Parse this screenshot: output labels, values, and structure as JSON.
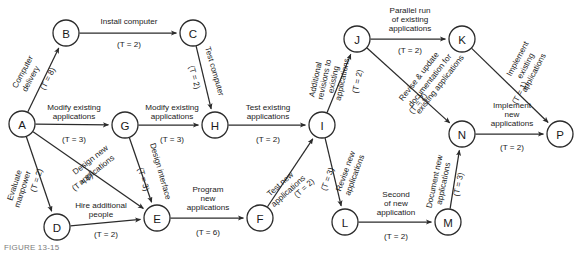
{
  "figure": {
    "type": "project-network-diagram",
    "caption": "FIGURE 13-15",
    "duration_prefix": "(T = ",
    "duration_suffix": ")"
  },
  "colors": {
    "stroke": "#2b2b2b",
    "background": "#ffffff",
    "text": "#1a1a1a",
    "caption": "#7c7c7c"
  },
  "nodes": [
    {
      "id": "A",
      "label": "A",
      "x": 22,
      "y": 124,
      "r": 13
    },
    {
      "id": "B",
      "label": "B",
      "x": 66,
      "y": 33,
      "r": 13
    },
    {
      "id": "C",
      "label": "C",
      "x": 193,
      "y": 33,
      "r": 13
    },
    {
      "id": "D",
      "label": "D",
      "x": 57,
      "y": 227,
      "r": 13
    },
    {
      "id": "E",
      "label": "E",
      "x": 157,
      "y": 218,
      "r": 13
    },
    {
      "id": "F",
      "label": "F",
      "x": 260,
      "y": 218,
      "r": 13
    },
    {
      "id": "G",
      "label": "G",
      "x": 125,
      "y": 125,
      "r": 13
    },
    {
      "id": "H",
      "label": "H",
      "x": 215,
      "y": 125,
      "r": 13
    },
    {
      "id": "I",
      "label": "I",
      "x": 322,
      "y": 125,
      "r": 13
    },
    {
      "id": "J",
      "label": "J",
      "x": 357,
      "y": 39,
      "r": 13
    },
    {
      "id": "K",
      "label": "K",
      "x": 462,
      "y": 39,
      "r": 13
    },
    {
      "id": "L",
      "label": "L",
      "x": 345,
      "y": 222,
      "r": 13
    },
    {
      "id": "M",
      "label": "M",
      "x": 448,
      "y": 222,
      "r": 13
    },
    {
      "id": "N",
      "label": "N",
      "x": 462,
      "y": 134,
      "r": 13
    },
    {
      "id": "P",
      "label": "P",
      "x": 560,
      "y": 134,
      "r": 13
    }
  ],
  "edges": [
    {
      "id": "A-B",
      "from": "A",
      "to": "B",
      "activity": [
        "Computer",
        "delivery"
      ],
      "duration": "(T = 8)",
      "duration_value": 8,
      "label_lines_pos": [
        {
          "x": 25,
          "y": 73
        },
        {
          "x": 33,
          "y": 80
        }
      ],
      "label_rotate": -62,
      "duration_pos": {
        "x": 50,
        "y": 80
      },
      "duration_rotate": -62
    },
    {
      "id": "B-C",
      "from": "B",
      "to": "C",
      "activity": [
        "Install computer"
      ],
      "duration": "(T = 2)",
      "duration_value": 2,
      "label_lines_pos": [
        {
          "x": 129,
          "y": 24
        }
      ],
      "label_rotate": 0,
      "duration_pos": {
        "x": 129,
        "y": 47
      },
      "duration_rotate": 0
    },
    {
      "id": "C-H",
      "from": "C",
      "to": "H",
      "activity": [
        "Test computer"
      ],
      "duration": "(T = 2)",
      "duration_value": 2,
      "label_lines_pos": [
        {
          "x": 212,
          "y": 72
        }
      ],
      "label_rotate": 74,
      "duration_pos": {
        "x": 192,
        "y": 78
      },
      "duration_rotate": 74
    },
    {
      "id": "A-G",
      "from": "A",
      "to": "G",
      "activity": [
        "Modify existing",
        "applications"
      ],
      "duration": "(T = 3)",
      "duration_value": 3,
      "label_lines_pos": [
        {
          "x": 74,
          "y": 110
        },
        {
          "x": 74,
          "y": 119
        }
      ],
      "label_rotate": 0,
      "duration_pos": {
        "x": 74,
        "y": 142
      },
      "duration_rotate": 0
    },
    {
      "id": "G-H",
      "from": "G",
      "to": "H",
      "activity": [
        "Modify existing",
        "applications"
      ],
      "duration": "(T = 3)",
      "duration_value": 3,
      "label_lines_pos": [
        {
          "x": 172,
          "y": 110
        },
        {
          "x": 172,
          "y": 119
        }
      ],
      "label_rotate": 0,
      "duration_pos": {
        "x": 172,
        "y": 142
      },
      "duration_rotate": 0
    },
    {
      "id": "H-I",
      "from": "H",
      "to": "I",
      "activity": [
        "Test existing",
        "applications"
      ],
      "duration": "(T = 2)",
      "duration_value": 2,
      "label_lines_pos": [
        {
          "x": 268,
          "y": 110
        },
        {
          "x": 268,
          "y": 119
        }
      ],
      "label_rotate": 0,
      "duration_pos": {
        "x": 268,
        "y": 142
      },
      "duration_rotate": 0
    },
    {
      "id": "A-D",
      "from": "A",
      "to": "D",
      "activity": [
        "Evaluate",
        "manpower"
      ],
      "duration": "(T = 2)",
      "duration_value": 2,
      "label_lines_pos": [
        {
          "x": 17,
          "y": 186
        },
        {
          "x": 25,
          "y": 190
        }
      ],
      "label_rotate": -72,
      "duration_pos": {
        "x": 39,
        "y": 181
      },
      "duration_rotate": -72
    },
    {
      "id": "A-E",
      "from": "A",
      "to": "E",
      "activity": [
        "Design new",
        "applications"
      ],
      "duration": "(T = 8)",
      "duration_value": 8,
      "label_lines_pos": [
        {
          "x": 92,
          "y": 162
        },
        {
          "x": 98,
          "y": 172
        }
      ],
      "label_rotate": -38,
      "duration_pos": {
        "x": 84,
        "y": 184
      },
      "duration_rotate": -38
    },
    {
      "id": "G-E",
      "from": "G",
      "to": "E",
      "activity": [
        "Design interface"
      ],
      "duration": "(T = 3)",
      "duration_value": 3,
      "label_lines_pos": [
        {
          "x": 158,
          "y": 172
        }
      ],
      "label_rotate": 74,
      "duration_pos": {
        "x": 141,
        "y": 180
      },
      "duration_rotate": 74
    },
    {
      "id": "D-E",
      "from": "D",
      "to": "E",
      "activity": [
        "Hire additional",
        "people"
      ],
      "duration": "(T = 2)",
      "duration_value": 2,
      "label_lines_pos": [
        {
          "x": 101,
          "y": 208
        },
        {
          "x": 101,
          "y": 217
        }
      ],
      "label_rotate": 0,
      "duration_pos": {
        "x": 106,
        "y": 237
      },
      "duration_rotate": 0
    },
    {
      "id": "E-F",
      "from": "E",
      "to": "F",
      "activity": [
        "Program",
        "new",
        "applications"
      ],
      "duration": "(T = 6)",
      "duration_value": 6,
      "label_lines_pos": [
        {
          "x": 208,
          "y": 192
        },
        {
          "x": 208,
          "y": 201
        },
        {
          "x": 208,
          "y": 210
        }
      ],
      "label_rotate": 0,
      "duration_pos": {
        "x": 208,
        "y": 235
      },
      "duration_rotate": 0
    },
    {
      "id": "F-I",
      "from": "F",
      "to": "I",
      "activity": [
        "Test new",
        "applications"
      ],
      "duration": "(T = 2)",
      "duration_value": 2,
      "label_lines_pos": [
        {
          "x": 282,
          "y": 186
        },
        {
          "x": 290,
          "y": 193
        }
      ],
      "label_rotate": -42,
      "duration_pos": {
        "x": 306,
        "y": 190
      },
      "duration_rotate": -42
    },
    {
      "id": "I-J",
      "from": "I",
      "to": "J",
      "activity": [
        "Additional",
        "revisions to",
        "existing",
        "applications"
      ],
      "duration": "(T = 2)",
      "duration_value": 2,
      "label_lines_pos": [
        {
          "x": 318,
          "y": 80
        },
        {
          "x": 327,
          "y": 80
        },
        {
          "x": 336,
          "y": 80
        },
        {
          "x": 345,
          "y": 80
        }
      ],
      "label_rotate": -78,
      "duration_pos": {
        "x": 360,
        "y": 82
      },
      "duration_rotate": -78
    },
    {
      "id": "J-K",
      "from": "J",
      "to": "K",
      "activity": [
        "Parallel run",
        "of existing",
        "applications"
      ],
      "duration": "(T = 2)",
      "duration_value": 2,
      "label_lines_pos": [
        {
          "x": 410,
          "y": 13
        },
        {
          "x": 410,
          "y": 22
        },
        {
          "x": 410,
          "y": 31
        }
      ],
      "label_rotate": 0,
      "duration_pos": {
        "x": 410,
        "y": 53
      },
      "duration_rotate": 0
    },
    {
      "id": "J-N",
      "from": "J",
      "to": "N",
      "activity": [
        "Revise & update",
        "documentation for",
        "existing applications"
      ],
      "duration": "(T = 2)",
      "duration_value": 2,
      "label_lines_pos": [
        {
          "x": 421,
          "y": 78
        },
        {
          "x": 432,
          "y": 82
        },
        {
          "x": 442,
          "y": 86
        }
      ],
      "label_rotate": -52,
      "duration_pos": {
        "x": 420,
        "y": 105
      },
      "duration_rotate": -52
    },
    {
      "id": "K-P",
      "from": "K",
      "to": "P",
      "activity": [
        "Implement",
        "existing",
        "applications"
      ],
      "duration": "(T = 1)",
      "duration_value": 1,
      "label_lines_pos": [
        {
          "x": 520,
          "y": 60
        },
        {
          "x": 528,
          "y": 67
        },
        {
          "x": 536,
          "y": 74
        }
      ],
      "label_rotate": -62,
      "duration_pos": {
        "x": 522,
        "y": 94
      },
      "duration_rotate": -62
    },
    {
      "id": "N-P",
      "from": "N",
      "to": "P",
      "activity": [
        "Implement",
        "new",
        "applications"
      ],
      "duration": "(T = 2)",
      "duration_value": 2,
      "label_lines_pos": [
        {
          "x": 512,
          "y": 108
        },
        {
          "x": 512,
          "y": 117
        },
        {
          "x": 512,
          "y": 126
        }
      ],
      "label_rotate": 0,
      "duration_pos": {
        "x": 512,
        "y": 150
      },
      "duration_rotate": 0
    },
    {
      "id": "I-L",
      "from": "I",
      "to": "L",
      "activity": [
        "Revise new",
        "applications"
      ],
      "duration": "(T = 3)",
      "duration_value": 3,
      "label_lines_pos": [
        {
          "x": 348,
          "y": 172
        },
        {
          "x": 357,
          "y": 176
        }
      ],
      "label_rotate": -70,
      "duration_pos": {
        "x": 330,
        "y": 180
      },
      "duration_rotate": -70
    },
    {
      "id": "L-M",
      "from": "L",
      "to": "M",
      "activity": [
        "Second",
        "of new",
        "application"
      ],
      "duration": "(T = 2)",
      "duration_value": 2,
      "label_lines_pos": [
        {
          "x": 396,
          "y": 197
        },
        {
          "x": 396,
          "y": 206
        },
        {
          "x": 396,
          "y": 215
        }
      ],
      "label_rotate": 0,
      "duration_pos": {
        "x": 396,
        "y": 239
      },
      "duration_rotate": 0
    },
    {
      "id": "M-N",
      "from": "M",
      "to": "N",
      "activity": [
        "Document new",
        "applications"
      ],
      "duration": "(T = 3)",
      "duration_value": 3,
      "label_lines_pos": [
        {
          "x": 437,
          "y": 182
        },
        {
          "x": 446,
          "y": 184
        }
      ],
      "label_rotate": -78,
      "duration_pos": {
        "x": 461,
        "y": 185
      },
      "duration_rotate": -78
    }
  ]
}
